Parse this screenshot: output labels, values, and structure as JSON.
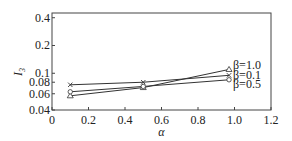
{
  "chart_data": {
    "type": "line",
    "title": "",
    "xlabel": "α",
    "ylabel": "I3",
    "ylabel_main": "I",
    "ylabel_sub": "3",
    "xlim": [
      0,
      1.2
    ],
    "ylim": [
      0.04,
      0.45
    ],
    "yscale": "log",
    "grid": false,
    "x_ticks": [
      0,
      0.2,
      0.4,
      0.6,
      0.8,
      1.0,
      1.2
    ],
    "x_tick_labels": [
      "0",
      "0.2",
      "0.4",
      "0.6",
      "0.8",
      "1.0",
      "1.2"
    ],
    "y_ticks": [
      0.04,
      0.06,
      0.08,
      0.1,
      0.2,
      0.4
    ],
    "y_tick_labels": [
      "0.04",
      "0.06",
      "0.08",
      "0.1",
      "0.2",
      "0.4"
    ],
    "legend_position": "inline-right",
    "series": [
      {
        "name": "β=1.0",
        "marker": "triangle",
        "x": [
          0.1,
          0.5,
          0.97
        ],
        "values": [
          0.057,
          0.07,
          0.11
        ]
      },
      {
        "name": "β=0.1",
        "marker": "cross",
        "x": [
          0.1,
          0.5,
          0.97
        ],
        "values": [
          0.075,
          0.08,
          0.095
        ]
      },
      {
        "name": "β=0.5",
        "marker": "circle",
        "x": [
          0.1,
          0.5,
          0.97
        ],
        "values": [
          0.063,
          0.072,
          0.085
        ]
      }
    ]
  }
}
